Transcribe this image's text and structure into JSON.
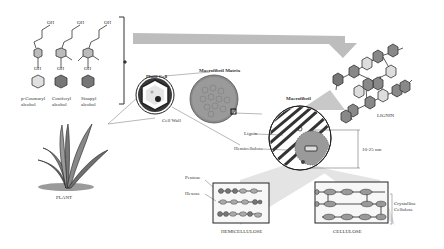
{
  "figure": {
    "monolignols": [
      {
        "name_line1": "p-Coumaryl",
        "name_line2": "alcohol"
      },
      {
        "name_line1": "Coniferyl",
        "name_line2": "alcohol"
      },
      {
        "name_line1": "Sinapyl",
        "name_line2": "alcohol"
      }
    ],
    "oh_label": "OH",
    "labels": {
      "plant": "PLANT",
      "plant_cell": "Plant Cell",
      "cell_wall": "Cell Wall",
      "macrofibril_matrix": "Macrofibril Matrix",
      "macrofibril": "Macrofibril",
      "lignin_label": "Lignin",
      "hemicellulose_label": "Hemicellulose",
      "lignin_title": "LIGNIN",
      "size": "10-25 nm",
      "pentose": "Pentose",
      "hexose": "Hexose",
      "hemicellulose_title": "HEMICELLULOSE",
      "cellulose_title": "CELLULOSE",
      "crystalline_line1": "Crystalline",
      "crystalline_line2": "Cellulose"
    },
    "colors": {
      "dark_gray": "#555555",
      "mid_gray": "#8a8a8a",
      "light_gray": "#c8c8c8",
      "arrow_gray": "#bdbdbd",
      "outline": "#222222"
    }
  }
}
